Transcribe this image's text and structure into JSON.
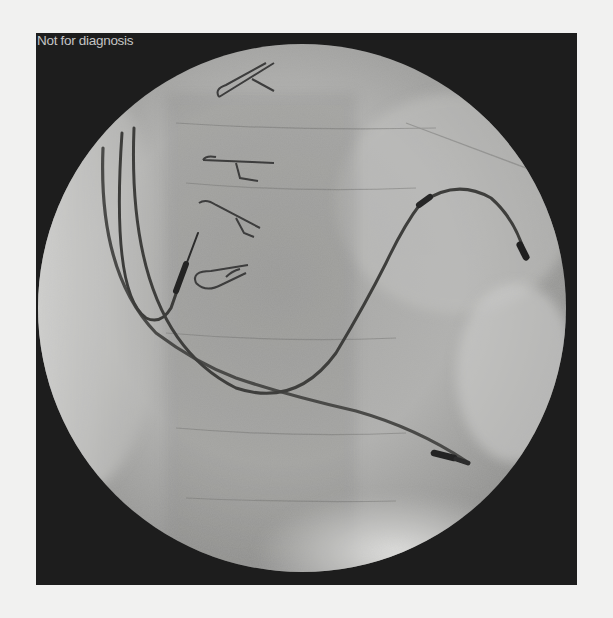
{
  "image": {
    "kind": "fluoroscopy-xray",
    "overlay_text": "Not for diagnosis",
    "colors": {
      "page_background": "#f1f1f0",
      "frame_background": "#1d1d1d",
      "field_light": "#d6d6d4",
      "field_mid": "#9c9c9a",
      "lead_dark": "#3a3a3a",
      "overlay_text": "#c4c4c4"
    },
    "content": {
      "circular_field": true,
      "visible_objects": [
        "surgical clips (4)",
        "pacing leads (3)",
        "lead electrodes",
        "vertebral bodies",
        "diaphragm shadow"
      ]
    }
  }
}
